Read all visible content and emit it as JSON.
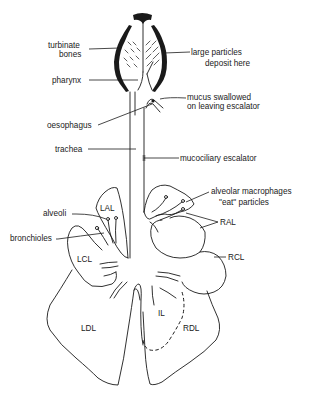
{
  "diagram": {
    "colors": {
      "ink": "#1a1a1a",
      "background": "#ffffff"
    },
    "labels": {
      "turbinate_line1": "turbinate",
      "turbinate_line2": "bones",
      "large_particles_line1": "large particles",
      "large_particles_line2": "deposit here",
      "pharynx": "pharynx",
      "mucus_line1": "mucus swallowed",
      "mucus_line2": "on leaving escalator",
      "oesophagus": "oesophagus",
      "trachea": "trachea",
      "mucociliary": "mucociliary escalator",
      "macrophages_line1": "alveolar macrophages",
      "macrophages_line2": "\"eat\" particles",
      "alveoli": "alveoli",
      "bronchioles": "bronchioles"
    },
    "lobes": {
      "LAL": "LAL",
      "RAL": "RAL",
      "LCL": "LCL",
      "RCL": "RCL",
      "IL": "IL",
      "LDL": "LDL",
      "RDL": "RDL"
    }
  }
}
